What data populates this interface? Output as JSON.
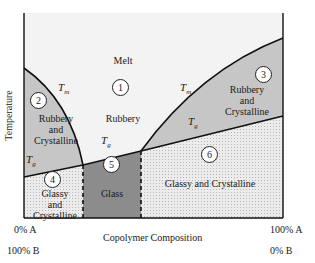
{
  "figure": {
    "y_axis_label": "Temperature",
    "x_axis_label": "Copolymer Composition",
    "x_left": {
      "a": "0% A",
      "b": "100% B"
    },
    "x_right": {
      "a": "100% A",
      "b": "0% B"
    },
    "curves": {
      "tm": "T",
      "tm_sub": "m",
      "tg": "T",
      "tg_sub": "g"
    },
    "colors": {
      "melt": "#f2f2f2",
      "rubbery_crystalline": "#c8c8c8",
      "glass": "#8a8a8a",
      "glassy_crystalline": "#e4e4e4",
      "line": "#111111"
    }
  },
  "regions": [
    {
      "number": "1",
      "label": "Melt",
      "sublabel": "Rubbery"
    },
    {
      "number": "2",
      "label": "Rubbery",
      "label2": "and",
      "label3": "Crystalline"
    },
    {
      "number": "3",
      "label": "Rubbery",
      "label2": "and",
      "label3": "Crystalline"
    },
    {
      "number": "4",
      "label": "Glassy",
      "label2": "and",
      "label3": "Crystalline"
    },
    {
      "number": "5",
      "label": "Glass"
    },
    {
      "number": "6",
      "label": "Glassy and Crystalline"
    }
  ]
}
